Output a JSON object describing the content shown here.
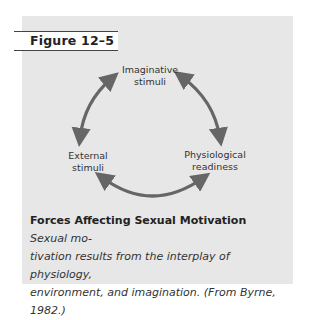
{
  "figure": {
    "label": "Figure 12–5",
    "colors": {
      "panel_background": "#e7e7e7",
      "arrow": "#666666",
      "label_background": "#ffffff"
    },
    "diagram": {
      "type": "cycle",
      "nodes": [
        {
          "id": "imaginative",
          "line1": "Imaginative",
          "line2": "stimuli"
        },
        {
          "id": "external",
          "line1": "External",
          "line2": "stimuli"
        },
        {
          "id": "physiological",
          "line1": "Physiological",
          "line2": "readiness"
        }
      ],
      "arrows": [
        {
          "from": "imaginative",
          "to": "external",
          "bidirectional": true
        },
        {
          "from": "imaginative",
          "to": "physiological",
          "bidirectional": true
        },
        {
          "from": "external",
          "to": "physiological",
          "bidirectional": true
        }
      ]
    },
    "caption": {
      "title": "Forces Affecting Sexual Motivation",
      "body_line1": "Sexual mo-",
      "body_line2": "tivation results from the interplay of physiology,",
      "body_line3": "environment, and imagination. (From Byrne,",
      "body_line4": "1982.)"
    }
  }
}
